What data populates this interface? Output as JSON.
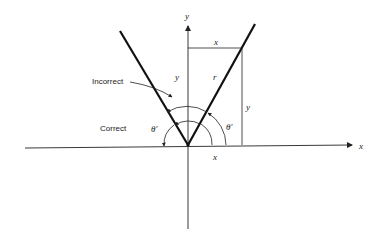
{
  "diagram": {
    "type": "angle-measurement-diagram",
    "axes": {
      "x_label": "x",
      "y_label": "y"
    },
    "labels": {
      "incorrect": "Incorrect",
      "correct": "Correct",
      "top_x": "x",
      "left_y": "y",
      "r": "r",
      "right_y": "y",
      "bottom_x": "x",
      "theta_left": "θ′",
      "theta_right": "θ′"
    },
    "colors": {
      "ink": "#222222",
      "background": "#ffffff"
    }
  }
}
